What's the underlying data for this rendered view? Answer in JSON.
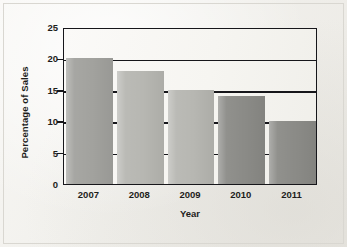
{
  "chart_data": {
    "type": "bar",
    "title": "",
    "subtitle": "",
    "xlabel": "Year",
    "ylabel": "Percentage of Sales",
    "categories": [
      "2007",
      "2008",
      "2009",
      "2010",
      "2011"
    ],
    "values": [
      20,
      18,
      15,
      14,
      10
    ],
    "series": [
      {
        "name": "Percentage of Sales",
        "values": [
          20,
          18,
          15,
          14,
          10
        ]
      }
    ],
    "ylim": [
      0,
      25
    ],
    "yticks": [
      0,
      5,
      10,
      15,
      20,
      25
    ],
    "ytick_labels": [
      "0",
      "5",
      "10",
      "15",
      "20",
      "25"
    ],
    "grid": "horizontal",
    "legend": "none",
    "bar_colors": [
      "#a2a29e",
      "#b7b7b2",
      "#b7b7b2",
      "#8b8b87",
      "#8b8b87"
    ],
    "annotations": [],
    "axis_color": "#16161a",
    "plot_background": "#f7f6f2",
    "page_background": "#f2f1ec",
    "frame_color": "#d9d7d1"
  }
}
